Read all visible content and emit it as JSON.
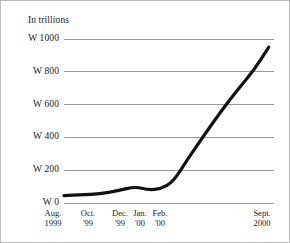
{
  "chart_data": {
    "type": "line",
    "title": "",
    "units_label": "In trillions",
    "xlabel": "",
    "ylabel": "",
    "ylim": [
      0,
      1000
    ],
    "y_ticks": [
      0,
      200,
      400,
      600,
      800,
      1000
    ],
    "y_tick_labels": [
      "W 0",
      "W 200",
      "W 400",
      "W 600",
      "W 800",
      "W 1000"
    ],
    "grid": true,
    "grid_axis": "y",
    "legend": "none",
    "currency_symbol": "W",
    "x_tick_labels": [
      {
        "line1": "Aug.",
        "line2": "1999"
      },
      {
        "line1": "Oct.",
        "line2": "'99"
      },
      {
        "line1": "Dec.",
        "line2": "'99"
      },
      {
        "line1": "Jan.",
        "line2": "'00"
      },
      {
        "line1": "Feb.",
        "line2": "'00"
      },
      {
        "line1": "Sept.",
        "line2": "2000"
      }
    ],
    "categories": [
      "Aug. 1999",
      "Sept. 1999",
      "Oct. 1999",
      "Nov. 1999",
      "Dec. 1999",
      "Jan. 2000",
      "Feb. 2000",
      "Mar. 2000",
      "Apr. 2000",
      "May 2000",
      "June 2000",
      "July 2000",
      "Aug. 2000",
      "Sept. 2000"
    ],
    "series": [
      {
        "name": "Value",
        "color": "#111111",
        "values": [
          45,
          50,
          55,
          75,
          100,
          80,
          85,
          130,
          260,
          400,
          545,
          680,
          810,
          950
        ]
      }
    ]
  },
  "geometry": {
    "plot_left": 63,
    "plot_right": 273,
    "y_pixel_top": 38,
    "y_pixel_bottom": 202,
    "x_label_positions": [
      52,
      87,
      119,
      139,
      159,
      261
    ],
    "x_label_top": 207,
    "y_label_right_edge": 58,
    "line_width": 3.2,
    "grid_color": "#9a9a9a",
    "grid_width": 1,
    "background": "#ffffff",
    "frame_color": "#bbbbbb",
    "data_x_fractions": [
      0.0,
      0.085,
      0.17,
      0.255,
      0.34,
      0.4,
      0.46,
      0.52,
      0.585,
      0.66,
      0.74,
      0.82,
      0.905,
      0.975
    ]
  }
}
